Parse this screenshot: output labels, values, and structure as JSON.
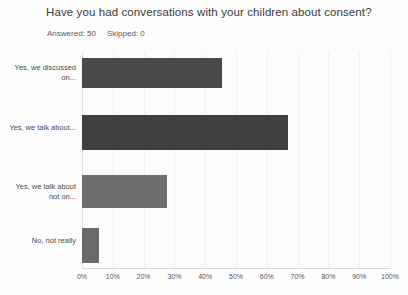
{
  "survey": {
    "title": "Have you had conversations with your children about consent?",
    "answered_label": "Answered: 50",
    "skipped_label": "Skipped: 0"
  },
  "chart_data": {
    "type": "bar",
    "orientation": "horizontal",
    "title": "Have you had conversations with your children about consent?",
    "subtitle": "Answered: 50   Skipped: 0",
    "xlabel": "",
    "ylabel": "",
    "xlim": [
      0,
      100
    ],
    "grid": true,
    "legend": "none",
    "categories": [
      "Yes, we discussed on...",
      "Yes, we talk about...",
      "Yes, we talk about not on...",
      "No, not really"
    ],
    "values": [
      45.5,
      67.0,
      27.5,
      5.5
    ],
    "value_unit": "%",
    "tick_labels": [
      "0%",
      "10%",
      "20%",
      "30%",
      "40%",
      "50%",
      "60%",
      "70%",
      "80%",
      "90%",
      "100%"
    ],
    "tick_values": [
      0,
      10,
      20,
      30,
      40,
      50,
      60,
      70,
      80,
      90,
      100
    ],
    "bar_colors": [
      "#4a4a4a",
      "#3f3f3f",
      "#6e6e6e",
      "#6a6a6a"
    ],
    "series": [
      {
        "name": "Percent of respondents",
        "values": [
          45.5,
          67.0,
          27.5,
          5.5
        ]
      }
    ]
  }
}
